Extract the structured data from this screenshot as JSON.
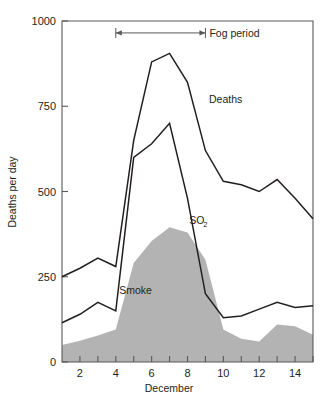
{
  "chart_data": {
    "type": "line",
    "title": "",
    "xlabel": "December",
    "ylabel": "Deaths per day",
    "xlim": [
      1,
      15
    ],
    "ylim": [
      0,
      1000
    ],
    "grid": false,
    "legend": "inline-labels",
    "x": [
      1,
      2,
      3,
      4,
      5,
      6,
      7,
      8,
      9,
      10,
      11,
      12,
      13,
      14,
      15
    ],
    "x_tick_labels": [
      "2",
      "4",
      "6",
      "8",
      "10",
      "12",
      "14"
    ],
    "x_tick_values": [
      2,
      4,
      6,
      8,
      10,
      12,
      14
    ],
    "y_tick_labels": [
      "0",
      "250",
      "500",
      "750",
      "1000"
    ],
    "y_tick_values": [
      0,
      250,
      500,
      750,
      1000
    ],
    "series": [
      {
        "name": "Deaths",
        "render": "line",
        "color": "#231f20",
        "values": [
          250,
          275,
          305,
          280,
          650,
          880,
          905,
          820,
          620,
          530,
          520,
          500,
          535,
          480,
          420
        ]
      },
      {
        "name": "SO2",
        "render": "line",
        "color": "#231f20",
        "values": [
          115,
          140,
          175,
          150,
          600,
          640,
          700,
          480,
          200,
          130,
          135,
          155,
          175,
          160,
          165
        ]
      },
      {
        "name": "Smoke",
        "render": "area",
        "color": "#b3b3b3",
        "values": [
          50,
          62,
          78,
          95,
          290,
          355,
          395,
          380,
          300,
          95,
          68,
          60,
          110,
          105,
          80
        ]
      }
    ],
    "annotations": [
      {
        "name": "fog-period",
        "label": "Fog period",
        "x_start": 4,
        "x_end": 9,
        "y": 965,
        "style": "double-arrow"
      },
      {
        "name": "deaths-label",
        "label": "Deaths",
        "x": 9.2,
        "y": 760
      },
      {
        "name": "so2-label",
        "label": "SO",
        "sub": "2",
        "x": 8.1,
        "y": 405
      },
      {
        "name": "smoke-label",
        "label": "Smoke",
        "x": 5.1,
        "y": 200
      }
    ]
  }
}
